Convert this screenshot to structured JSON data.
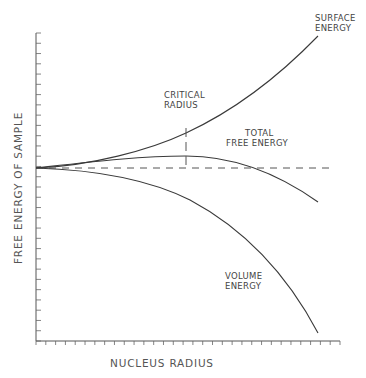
{
  "chart_data": {
    "type": "line",
    "title": "",
    "xlabel": "NUCLEUS RADIUS",
    "ylabel": "FREE ENERGY OF SAMPLE",
    "grid": false,
    "legend": "none (inline curve labels)",
    "x": [
      0,
      0.1,
      0.2,
      0.3,
      0.4,
      0.5,
      0.6,
      0.7,
      0.8,
      0.9,
      1.0
    ],
    "series": [
      {
        "name": "SURFACE ENERGY",
        "values": [
          0,
          0.01,
          0.04,
          0.09,
          0.16,
          0.25,
          0.36,
          0.49,
          0.64,
          0.81,
          1.0
        ]
      },
      {
        "name": "TOTAL FREE ENERGY",
        "values": [
          0,
          0.01,
          0.03,
          0.06,
          0.08,
          0.09,
          0.08,
          0.04,
          -0.03,
          -0.13,
          -0.26
        ]
      },
      {
        "name": "VOLUME ENERGY",
        "values": [
          0,
          -0.001,
          -0.01,
          -0.03,
          -0.08,
          -0.16,
          -0.28,
          -0.45,
          -0.67,
          -0.95,
          -1.26
        ]
      }
    ],
    "annotations": [
      {
        "text": "CRITICAL RADIUS",
        "x": 0.53,
        "note": "dashed vertical at maximum of total free energy"
      },
      {
        "text": "zero reference",
        "note": "dashed horizontal line at y = 0"
      }
    ],
    "x_ticks": 32,
    "y_ticks": 31
  },
  "labels": {
    "surface_1": "SURFACE",
    "surface_2": "ENERGY",
    "critical_1": "CRITICAL",
    "critical_2": "RADIUS",
    "total_1": "TOTAL",
    "total_2": "FREE ENERGY",
    "volume_1": "VOLUME",
    "volume_2": "ENERGY",
    "xaxis": "NUCLEUS RADIUS",
    "yaxis": "FREE ENERGY OF SAMPLE"
  }
}
